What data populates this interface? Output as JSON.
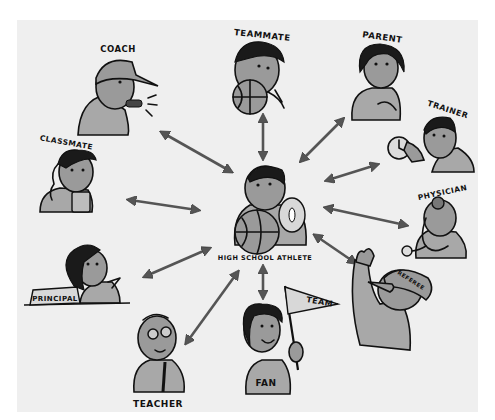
{
  "diagram": {
    "type": "hub-and-spoke illustration",
    "center": {
      "id": "athlete",
      "label": "HIGH SCHOOL ATHLETE"
    },
    "nodes": [
      {
        "id": "coach",
        "label": "COACH"
      },
      {
        "id": "teammate",
        "label": "TEAMMATE"
      },
      {
        "id": "parent",
        "label": "PARENT"
      },
      {
        "id": "trainer",
        "label": "TRAINER"
      },
      {
        "id": "physician",
        "label": "PHYSICIAN"
      },
      {
        "id": "referee",
        "label": "REFEREE"
      },
      {
        "id": "fan",
        "label": "FAN"
      },
      {
        "id": "teacher",
        "label": "TEACHER"
      },
      {
        "id": "principal",
        "label": "PRINCIPAL"
      },
      {
        "id": "classmate",
        "label": "CLASSMATE"
      }
    ],
    "props": {
      "fan_pennant": "TEAM",
      "principal_nameplate": "PRINCIPAL",
      "referee_cap": "REFEREE",
      "fan_shirt": "FAN"
    },
    "edges": [
      {
        "from": "athlete",
        "to": "coach",
        "style": "double-arrow"
      },
      {
        "from": "athlete",
        "to": "teammate",
        "style": "double-arrow"
      },
      {
        "from": "athlete",
        "to": "parent",
        "style": "double-arrow"
      },
      {
        "from": "athlete",
        "to": "trainer",
        "style": "double-arrow"
      },
      {
        "from": "athlete",
        "to": "physician",
        "style": "double-arrow"
      },
      {
        "from": "athlete",
        "to": "referee",
        "style": "double-arrow"
      },
      {
        "from": "athlete",
        "to": "fan",
        "style": "double-arrow"
      },
      {
        "from": "athlete",
        "to": "teacher",
        "style": "double-arrow"
      },
      {
        "from": "athlete",
        "to": "principal",
        "style": "double-arrow"
      },
      {
        "from": "athlete",
        "to": "classmate",
        "style": "double-arrow"
      }
    ]
  },
  "colors": {
    "page_background": "#ffffff",
    "panel_background": "#efefef",
    "ink": "#111111",
    "arrow": "#555555"
  }
}
